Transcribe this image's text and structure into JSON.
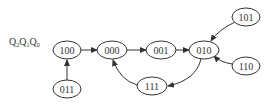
{
  "diagram": {
    "type": "state-transition",
    "label": {
      "text": "Q2Q1Q0",
      "parts": [
        {
          "main": "Q",
          "sub": "2"
        },
        {
          "main": "Q",
          "sub": "1"
        },
        {
          "main": "Q",
          "sub": "0"
        }
      ]
    },
    "nodes": [
      {
        "id": "100",
        "label": "100"
      },
      {
        "id": "000",
        "label": "000"
      },
      {
        "id": "001",
        "label": "001"
      },
      {
        "id": "010",
        "label": "010"
      },
      {
        "id": "101",
        "label": "101"
      },
      {
        "id": "110",
        "label": "110"
      },
      {
        "id": "011",
        "label": "011"
      },
      {
        "id": "111",
        "label": "111"
      }
    ],
    "edges": [
      {
        "from": "011",
        "to": "100"
      },
      {
        "from": "100",
        "to": "000"
      },
      {
        "from": "000",
        "to": "001"
      },
      {
        "from": "001",
        "to": "010"
      },
      {
        "from": "101",
        "to": "010"
      },
      {
        "from": "110",
        "to": "010"
      },
      {
        "from": "010",
        "to": "111"
      },
      {
        "from": "111",
        "to": "000"
      }
    ],
    "colors": {
      "stroke": "#333333",
      "background": "#ffffff"
    }
  }
}
